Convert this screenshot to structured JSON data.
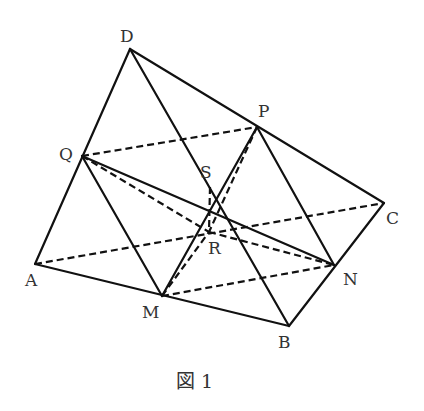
{
  "figure": {
    "caption": "図 1",
    "points": {
      "D": {
        "label": "D",
        "x": 130,
        "y": 49,
        "lx": 120,
        "ly": 42
      },
      "P": {
        "label": "P",
        "x": 257,
        "y": 127,
        "lx": 258,
        "ly": 117
      },
      "C": {
        "label": "C",
        "x": 384,
        "y": 203,
        "lx": 386,
        "ly": 224
      },
      "Q": {
        "label": "Q",
        "x": 82,
        "y": 156,
        "lx": 59,
        "ly": 160
      },
      "S": {
        "label": "S",
        "x": 210,
        "y": 187,
        "lx": 200,
        "ly": 178
      },
      "R": {
        "label": "R",
        "x": 209,
        "y": 232,
        "lx": 208,
        "ly": 254
      },
      "A": {
        "label": "A",
        "x": 35,
        "y": 264,
        "lx": 25,
        "ly": 286
      },
      "M": {
        "label": "M",
        "x": 162,
        "y": 296,
        "lx": 142,
        "ly": 318
      },
      "N": {
        "label": "N",
        "x": 334,
        "y": 265,
        "lx": 343,
        "ly": 285
      },
      "B": {
        "label": "B",
        "x": 289,
        "y": 326,
        "lx": 278,
        "ly": 348
      }
    },
    "solid_edges": [
      [
        "D",
        "A"
      ],
      [
        "D",
        "C"
      ],
      [
        "D",
        "B"
      ],
      [
        "A",
        "B"
      ],
      [
        "B",
        "C"
      ],
      [
        "Q",
        "M"
      ],
      [
        "Q",
        "N"
      ],
      [
        "P",
        "M"
      ],
      [
        "P",
        "N"
      ]
    ],
    "dashed_edges": [
      [
        "A",
        "C"
      ],
      [
        "Q",
        "P"
      ],
      [
        "M",
        "N"
      ],
      [
        "Q",
        "R"
      ],
      [
        "R",
        "N"
      ],
      [
        "P",
        "R"
      ],
      [
        "S",
        "R"
      ],
      [
        "M",
        "R"
      ]
    ]
  }
}
